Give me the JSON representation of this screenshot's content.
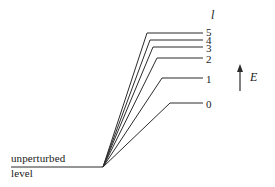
{
  "figure": {
    "background_color": "#ffffff",
    "line_color": "#2b2b2b",
    "baseline_label_top": "unperturbed",
    "baseline_label_bottom": "level",
    "quantum_number_symbol": "l",
    "energy_axis_symbol": "E"
  },
  "chart_data": {
    "type": "line",
    "xlabel": "",
    "ylabel": "E",
    "grid": false,
    "legend": "none",
    "annotations": [
      {
        "name": "quantum-number-header",
        "text": "l",
        "x": 211,
        "y": 16
      },
      {
        "name": "energy-axis-label",
        "text": "E",
        "x": 250,
        "y": 78
      },
      {
        "name": "baseline-caption-top",
        "text": "unperturbed",
        "x": 11,
        "y": 160
      },
      {
        "name": "baseline-caption-bottom",
        "text": "level",
        "x": 11,
        "y": 175
      }
    ],
    "baseline": {
      "x_start": 11,
      "x_end": 103,
      "y": 167
    },
    "fan_origin": {
      "x": 103,
      "y": 167
    },
    "levels": [
      {
        "label": "5",
        "knee_x": 147,
        "level_y": 33,
        "end_x": 203,
        "label_x": 206,
        "label_y": 33
      },
      {
        "label": "4",
        "knee_x": 150,
        "level_y": 40,
        "end_x": 203,
        "label_x": 206,
        "label_y": 41
      },
      {
        "label": "3",
        "knee_x": 153,
        "level_y": 47,
        "end_x": 203,
        "label_x": 206,
        "label_y": 49
      },
      {
        "label": "2",
        "knee_x": 157,
        "level_y": 58,
        "end_x": 203,
        "label_x": 206,
        "label_y": 60
      },
      {
        "label": "1",
        "knee_x": 162,
        "level_y": 78,
        "end_x": 203,
        "label_x": 206,
        "label_y": 80
      },
      {
        "label": "0",
        "knee_x": 170,
        "level_y": 103,
        "end_x": 203,
        "label_x": 206,
        "label_y": 105
      }
    ],
    "arrow": {
      "x": 240,
      "y_tail": 91,
      "y_head": 64,
      "direction": "up"
    }
  }
}
